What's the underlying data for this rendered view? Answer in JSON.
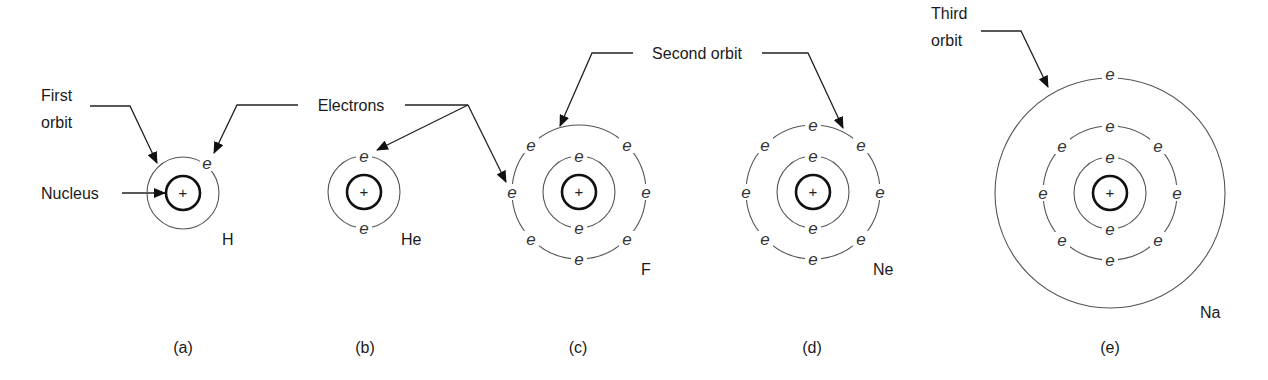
{
  "figure": {
    "callouts": {
      "first_orbit": [
        "First",
        "orbit"
      ],
      "nucleus": "Nucleus",
      "electrons": "Electrons",
      "second_orbit": "Second orbit",
      "third_orbit": [
        "Third",
        "orbit"
      ]
    },
    "electron_symbol": "e",
    "nucleus_symbol": "+",
    "atoms": [
      {
        "id": "a",
        "symbol": "H",
        "caption": "(a)",
        "shells": [
          1
        ]
      },
      {
        "id": "b",
        "symbol": "He",
        "caption": "(b)",
        "shells": [
          2
        ]
      },
      {
        "id": "c",
        "symbol": "F",
        "caption": "(c)",
        "shells": [
          2,
          7
        ]
      },
      {
        "id": "d",
        "symbol": "Ne",
        "caption": "(d)",
        "shells": [
          2,
          8
        ]
      },
      {
        "id": "e",
        "symbol": "Na",
        "caption": "(e)",
        "shells": [
          2,
          8,
          1
        ]
      }
    ],
    "colors": {
      "ink": "#1a1a1a",
      "orbit": "#555555",
      "background": "#ffffff"
    }
  }
}
